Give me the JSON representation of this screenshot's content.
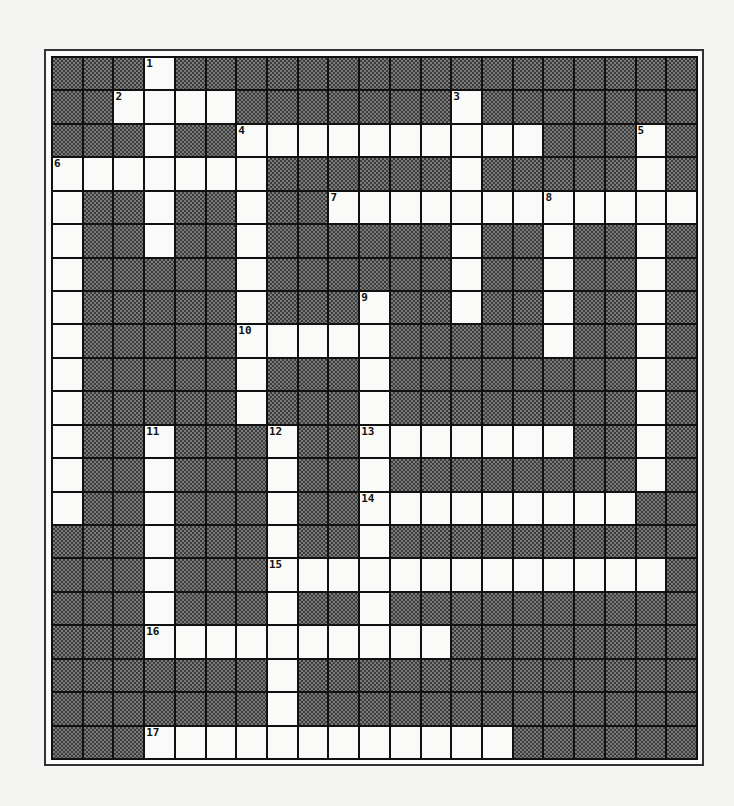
{
  "puzzle": {
    "rows": 21,
    "cols": 21,
    "white_cells": {
      "0": [
        3
      ],
      "1": [
        2,
        3,
        4,
        5,
        13
      ],
      "2": [
        3,
        6,
        7,
        8,
        9,
        10,
        11,
        12,
        13,
        14,
        15,
        19
      ],
      "3": [
        0,
        1,
        2,
        3,
        4,
        5,
        6,
        13,
        19
      ],
      "4": [
        0,
        3,
        6,
        9,
        10,
        11,
        12,
        13,
        14,
        15,
        16,
        17,
        18,
        19,
        20
      ],
      "5": [
        0,
        3,
        6,
        13,
        16,
        19
      ],
      "6": [
        0,
        6,
        13,
        16,
        19
      ],
      "7": [
        0,
        6,
        10,
        13,
        16,
        19
      ],
      "8": [
        0,
        6,
        7,
        8,
        9,
        10,
        16,
        19
      ],
      "9": [
        0,
        6,
        10,
        19
      ],
      "10": [
        0,
        6,
        10,
        19
      ],
      "11": [
        0,
        3,
        7,
        10,
        11,
        12,
        13,
        14,
        15,
        16,
        19
      ],
      "12": [
        0,
        3,
        7,
        10,
        19
      ],
      "13": [
        0,
        3,
        7,
        10,
        11,
        12,
        13,
        14,
        15,
        16,
        17,
        18
      ],
      "14": [
        3,
        7,
        10
      ],
      "15": [
        3,
        7,
        8,
        9,
        10,
        11,
        12,
        13,
        14,
        15,
        16,
        17,
        18,
        19
      ],
      "16": [
        3,
        7,
        10
      ],
      "17": [
        3,
        4,
        5,
        6,
        7,
        8,
        9,
        10,
        11,
        12
      ],
      "18": [
        7
      ],
      "19": [
        7
      ],
      "20": [
        3,
        4,
        5,
        6,
        7,
        8,
        9,
        10,
        11,
        12,
        13,
        14
      ]
    },
    "numbers": [
      {
        "n": "1",
        "r": 0,
        "c": 3
      },
      {
        "n": "2",
        "r": 1,
        "c": 2
      },
      {
        "n": "3",
        "r": 1,
        "c": 13
      },
      {
        "n": "4",
        "r": 2,
        "c": 6
      },
      {
        "n": "5",
        "r": 2,
        "c": 19
      },
      {
        "n": "6",
        "r": 3,
        "c": 0
      },
      {
        "n": "7",
        "r": 4,
        "c": 9
      },
      {
        "n": "8",
        "r": 4,
        "c": 16
      },
      {
        "n": "9",
        "r": 7,
        "c": 10
      },
      {
        "n": "10",
        "r": 8,
        "c": 6
      },
      {
        "n": "11",
        "r": 11,
        "c": 3
      },
      {
        "n": "12",
        "r": 11,
        "c": 7
      },
      {
        "n": "13",
        "r": 11,
        "c": 10
      },
      {
        "n": "14",
        "r": 13,
        "c": 10
      },
      {
        "n": "15",
        "r": 15,
        "c": 7
      },
      {
        "n": "16",
        "r": 17,
        "c": 3
      },
      {
        "n": "17",
        "r": 20,
        "c": 3
      }
    ]
  }
}
